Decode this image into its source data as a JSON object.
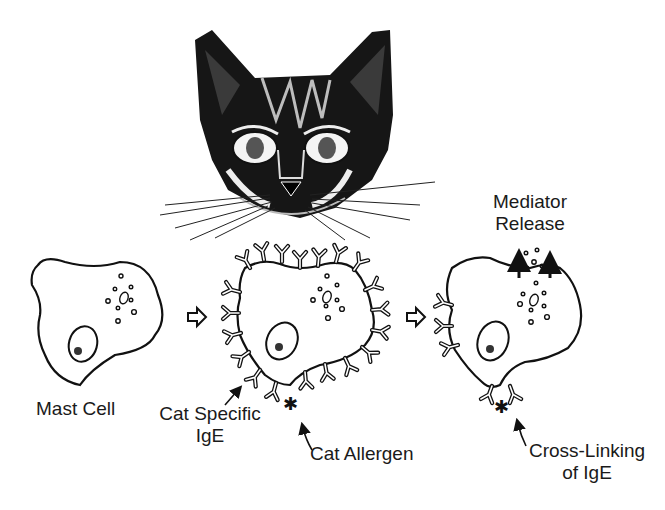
{
  "diagram": {
    "illustration": "cat-head-ink-drawing",
    "colors": {
      "ink": "#111111",
      "background": "#ffffff"
    },
    "labels": {
      "mast_cell": "Mast Cell",
      "cat_specific_ige_line1": "Cat Specific",
      "cat_specific_ige_line2": "IgE",
      "cat_allergen": "Cat Allergen",
      "mediator_release_line1": "Mediator",
      "mediator_release_line2": "Release",
      "cross_linking_line1": "Cross-Linking",
      "cross_linking_line2": "of IgE"
    },
    "stages": [
      {
        "id": 1,
        "name": "Mast Cell"
      },
      {
        "id": 2,
        "name": "IgE-sensitized mast cell with cat allergen"
      },
      {
        "id": 3,
        "name": "Cross-linking of IgE and mediator release"
      }
    ],
    "flow_arrows": 2
  }
}
